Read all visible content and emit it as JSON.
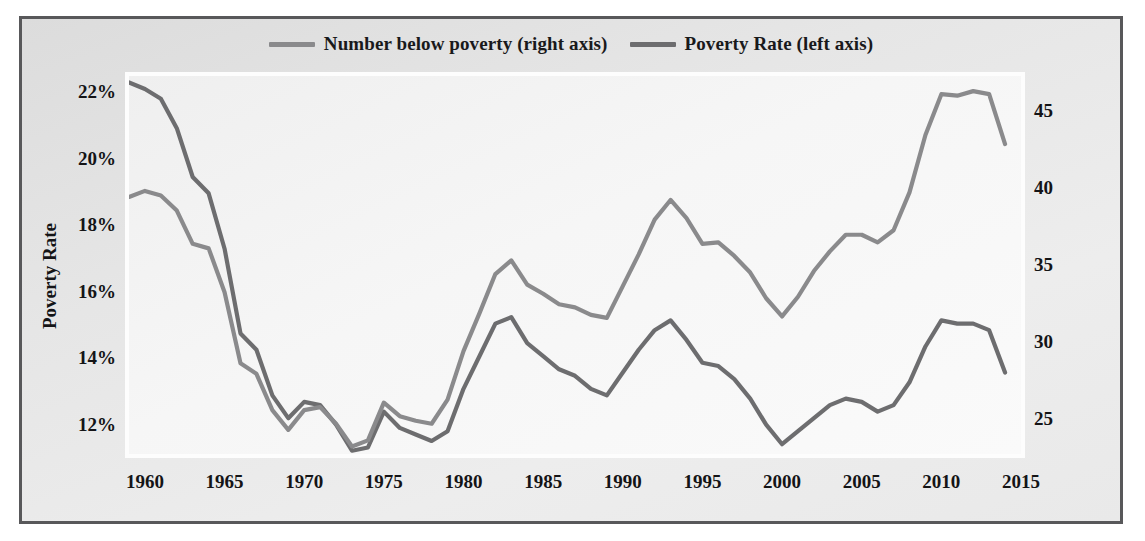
{
  "legend": {
    "entries": [
      {
        "label": "Number below poverty (right axis)",
        "color": "#8a8a8c",
        "swatch_name": "legend-swatch-number"
      },
      {
        "label": "Poverty Rate (left axis)",
        "color": "#6d6d6f",
        "swatch_name": "legend-swatch-rate"
      }
    ]
  },
  "axes": {
    "left_title": "Poverty Rate",
    "right_title": "Number below poverty, in millions",
    "left_ticks": [
      "12%",
      "14%",
      "16%",
      "18%",
      "20%",
      "22%"
    ],
    "right_ticks": [
      "25",
      "30",
      "35",
      "40",
      "45"
    ],
    "x_ticks": [
      "1960",
      "1965",
      "1970",
      "1975",
      "1980",
      "1985",
      "1990",
      "1995",
      "2000",
      "2005",
      "2010",
      "2015"
    ]
  },
  "chart_data": {
    "type": "line",
    "title": "",
    "xlabel": "",
    "ylabel": "Poverty Rate",
    "y2label": "Number below poverty, in millions",
    "xlim": [
      1959,
      2015
    ],
    "ylim": [
      11.0,
      22.6
    ],
    "y2lim": [
      22.5,
      47.5
    ],
    "ytick_values": [
      12,
      14,
      16,
      18,
      20,
      22
    ],
    "y2tick_values": [
      25,
      30,
      35,
      40,
      45
    ],
    "xtick_values": [
      1960,
      1965,
      1970,
      1975,
      1980,
      1985,
      1990,
      1995,
      2000,
      2005,
      2010,
      2015
    ],
    "grid": false,
    "legend_position": "top-center",
    "x": [
      1959,
      1960,
      1961,
      1962,
      1963,
      1964,
      1965,
      1966,
      1967,
      1968,
      1969,
      1970,
      1971,
      1972,
      1973,
      1974,
      1975,
      1976,
      1977,
      1978,
      1979,
      1980,
      1981,
      1982,
      1983,
      1984,
      1985,
      1986,
      1987,
      1988,
      1989,
      1990,
      1991,
      1992,
      1993,
      1994,
      1995,
      1996,
      1997,
      1998,
      1999,
      2000,
      2001,
      2002,
      2003,
      2004,
      2005,
      2006,
      2007,
      2008,
      2009,
      2010,
      2011,
      2012,
      2013,
      2014
    ],
    "series": [
      {
        "name": "Poverty Rate (left axis)",
        "axis": "left",
        "units": "percent",
        "color": "#6d6d6f",
        "values": [
          22.4,
          22.2,
          21.9,
          21.0,
          19.5,
          19.0,
          17.3,
          14.7,
          14.2,
          12.8,
          12.1,
          12.6,
          12.5,
          11.9,
          11.1,
          11.2,
          12.3,
          11.8,
          11.6,
          11.4,
          11.7,
          13.0,
          14.0,
          15.0,
          15.2,
          14.4,
          14.0,
          13.6,
          13.4,
          13.0,
          12.8,
          13.5,
          14.2,
          14.8,
          15.1,
          14.5,
          13.8,
          13.7,
          13.3,
          12.7,
          11.9,
          11.3,
          11.7,
          12.1,
          12.5,
          12.7,
          12.6,
          12.3,
          12.5,
          13.2,
          14.3,
          15.1,
          15.0,
          15.0,
          14.8,
          13.5
        ]
      },
      {
        "name": "Number below poverty (right axis)",
        "axis": "right",
        "units": "millions",
        "color": "#8a8a8c",
        "values": [
          39.5,
          39.9,
          39.6,
          38.6,
          36.4,
          36.1,
          33.2,
          28.5,
          27.8,
          25.4,
          24.1,
          25.4,
          25.6,
          24.5,
          23.0,
          23.4,
          25.9,
          25.0,
          24.7,
          24.5,
          26.1,
          29.3,
          31.8,
          34.4,
          35.3,
          33.7,
          33.1,
          32.4,
          32.2,
          31.7,
          31.5,
          33.6,
          35.7,
          38.0,
          39.3,
          38.1,
          36.4,
          36.5,
          35.6,
          34.5,
          32.8,
          31.6,
          32.9,
          34.6,
          35.9,
          37.0,
          37.0,
          36.5,
          37.3,
          39.8,
          43.6,
          46.3,
          46.2,
          46.5,
          46.3,
          43.0
        ]
      }
    ]
  }
}
